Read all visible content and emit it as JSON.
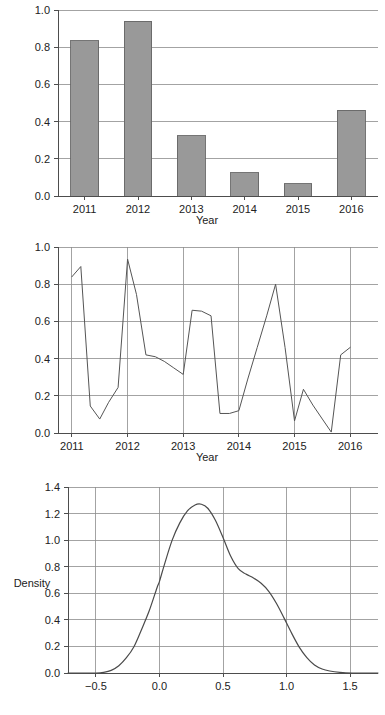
{
  "chart_data": [
    {
      "type": "bar",
      "title": "",
      "xlabel": "Year",
      "ylabel": "",
      "categories": [
        "2011",
        "2012",
        "2013",
        "2014",
        "2015",
        "2016"
      ],
      "values": [
        0.835,
        0.94,
        0.325,
        0.125,
        0.065,
        0.46
      ],
      "ylim": [
        0.0,
        1.0
      ],
      "ytick_labels": [
        "0.0",
        "0.2",
        "0.4",
        "0.6",
        "0.8",
        "1.0"
      ],
      "ytick_values": [
        0.0,
        0.2,
        0.4,
        0.6,
        0.8,
        1.0
      ],
      "xtick_labels": [
        "2011",
        "2012",
        "2013",
        "2014",
        "2015",
        "2016"
      ],
      "grid": "horizontal",
      "legend": "none",
      "bar_fill": "#999999",
      "bar_stroke": "#666666"
    },
    {
      "type": "line",
      "title": "",
      "xlabel": "Year",
      "ylabel": "",
      "ylim": [
        0.0,
        1.0
      ],
      "xlim": [
        2010.75,
        2016.5
      ],
      "ytick_labels": [
        "0.0",
        "0.2",
        "0.4",
        "0.6",
        "0.8",
        "1.0"
      ],
      "ytick_values": [
        0.0,
        0.2,
        0.4,
        0.6,
        0.8,
        1.0
      ],
      "xtick_labels": [
        "2011",
        "2012",
        "2013",
        "2014",
        "2015",
        "2016"
      ],
      "xtick_values": [
        2011,
        2012,
        2013,
        2014,
        2015,
        2016
      ],
      "grid": "both",
      "legend": "none",
      "line_color": "#555555",
      "x": [
        2011.0,
        2011.16,
        2011.33,
        2011.5,
        2011.66,
        2011.83,
        2012.0,
        2012.16,
        2012.33,
        2012.5,
        2012.66,
        2012.83,
        2013.0,
        2013.16,
        2013.33,
        2013.5,
        2013.66,
        2013.83,
        2014.0,
        2014.16,
        2014.33,
        2014.5,
        2014.66,
        2014.83,
        2015.0,
        2015.16,
        2015.33,
        2015.5,
        2015.66,
        2015.83,
        2016.0
      ],
      "y": [
        0.84,
        0.895,
        0.145,
        0.075,
        0.165,
        0.245,
        0.935,
        0.745,
        0.42,
        0.41,
        0.385,
        0.35,
        0.315,
        0.66,
        0.655,
        0.63,
        0.105,
        0.105,
        0.12,
        0.29,
        0.46,
        0.63,
        0.8,
        0.46,
        0.065,
        0.235,
        0.15,
        0.075,
        0.005,
        0.42,
        0.46
      ]
    },
    {
      "type": "line",
      "subtype": "density",
      "title": "",
      "xlabel": "",
      "ylabel": "Density",
      "ylim": [
        0.0,
        1.4
      ],
      "xlim": [
        -0.72,
        1.72
      ],
      "ytick_labels": [
        "0.0",
        "0.2",
        "0.4",
        "0.6",
        "0.8",
        "1.0",
        "1.2",
        "1.4"
      ],
      "ytick_values": [
        0.0,
        0.2,
        0.4,
        0.6,
        0.8,
        1.0,
        1.2,
        1.4
      ],
      "xtick_labels": [
        "−0.5",
        "0.0",
        "0.5",
        "1.0",
        "1.5"
      ],
      "xtick_values": [
        -0.5,
        0.0,
        0.5,
        1.0,
        1.5
      ],
      "grid": "both",
      "legend": "none",
      "line_color": "#4a4a4a",
      "x": [
        -0.72,
        -0.6,
        -0.5,
        -0.44,
        -0.38,
        -0.32,
        -0.26,
        -0.2,
        -0.14,
        -0.08,
        -0.02,
        0.0,
        0.04,
        0.1,
        0.16,
        0.22,
        0.28,
        0.33,
        0.38,
        0.44,
        0.5,
        0.56,
        0.62,
        0.68,
        0.74,
        0.8,
        0.86,
        0.92,
        0.98,
        1.04,
        1.1,
        1.16,
        1.22,
        1.28,
        1.34,
        1.42,
        1.52,
        1.62,
        1.72
      ],
      "y": [
        0.0,
        0.0,
        0.0,
        0.005,
        0.02,
        0.055,
        0.115,
        0.2,
        0.33,
        0.47,
        0.64,
        0.69,
        0.82,
        1.0,
        1.13,
        1.22,
        1.265,
        1.27,
        1.24,
        1.15,
        1.02,
        0.88,
        0.785,
        0.745,
        0.715,
        0.675,
        0.615,
        0.525,
        0.415,
        0.3,
        0.195,
        0.115,
        0.06,
        0.03,
        0.015,
        0.005,
        0.0,
        0.0,
        0.0
      ]
    }
  ],
  "labels": {
    "bar_xaxis_title": "Year",
    "line_xaxis_title": "Year",
    "density_yaxis_title": "Density"
  }
}
